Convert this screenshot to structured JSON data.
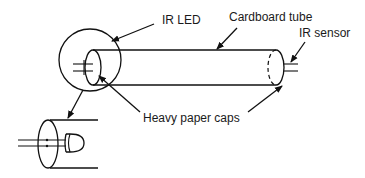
{
  "diagram": {
    "labels": {
      "ir_led": "IR LED",
      "cardboard_tube": "Cardboard tube",
      "ir_sensor": "IR sensor",
      "heavy_paper_caps": "Heavy paper caps"
    },
    "colors": {
      "line": "#111111",
      "text": "#1a1a1a",
      "background": "#ffffff"
    }
  }
}
